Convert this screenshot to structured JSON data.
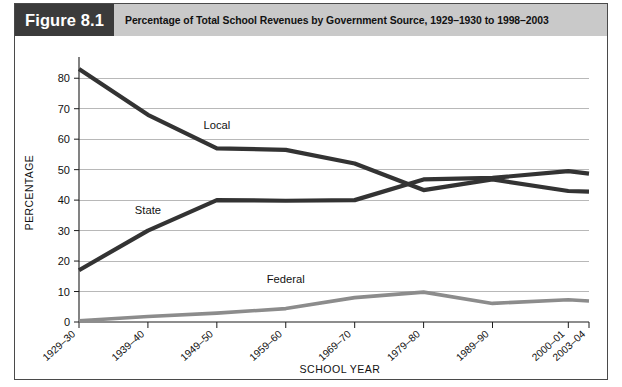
{
  "figure": {
    "tag": "Figure 8.1",
    "title": "Percentage of Total School Revenues by Government Source, 1929–1930 to 1998–2003"
  },
  "colors": {
    "tag_background": "#3b3b3b",
    "header_background": "#c9c9c9",
    "frame_border": "#4a4a4a",
    "grid": "#9a9a9a",
    "local_line": "#333333",
    "state_line": "#333333",
    "federal_line": "#8c8c8c",
    "text": "#111111"
  },
  "chart_data": {
    "type": "line",
    "title": "Percentage of Total School Revenues by Government Source, 1929–1930 to 1998–2003",
    "xlabel": "SCHOOL YEAR",
    "ylabel": "PERCENTAGE",
    "categories": [
      "1929–30",
      "1939–40",
      "1949–50",
      "1959–60",
      "1969–70",
      "1979–80",
      "1989–90",
      "2000–01",
      "2003–04"
    ],
    "x": [
      1929,
      1939,
      1949,
      1959,
      1969,
      1979,
      1989,
      2000,
      2003
    ],
    "ylim": [
      0,
      85
    ],
    "yticks": [
      0,
      10,
      20,
      30,
      40,
      50,
      60,
      70,
      80
    ],
    "ytick_labels": [
      "0",
      "10",
      "20",
      "30",
      "40",
      "50",
      "60",
      "70",
      "80"
    ],
    "grid": true,
    "legend": "inline-labels",
    "series": [
      {
        "name": "Local",
        "label": "Local",
        "color": "#333333",
        "width": 4.2,
        "values": [
          83.0,
          68.0,
          57.0,
          56.5,
          52.0,
          43.3,
          46.8,
          43.0,
          42.8
        ]
      },
      {
        "name": "State",
        "label": "State",
        "color": "#333333",
        "width": 4.2,
        "values": [
          17.0,
          30.0,
          40.0,
          39.8,
          40.0,
          46.8,
          47.3,
          49.5,
          48.7
        ]
      },
      {
        "name": "Federal",
        "label": "Federal",
        "color": "#8c8c8c",
        "width": 3.6,
        "values": [
          0.4,
          1.8,
          2.9,
          4.4,
          8.0,
          9.8,
          6.1,
          7.3,
          6.9
        ]
      }
    ],
    "annotations": [
      {
        "text": "Local",
        "x_index": 2,
        "value": 63.5
      },
      {
        "text": "State",
        "x_index": 1,
        "value": 35.5
      },
      {
        "text": "Federal",
        "x_index": 3,
        "value": 12.8
      }
    ]
  }
}
